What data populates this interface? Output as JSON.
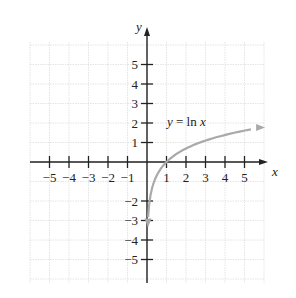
{
  "chart_data": {
    "type": "line",
    "title": "",
    "function_label": "y = ln x",
    "xlabel": "x",
    "ylabel": "y",
    "xlim": [
      -5,
      5
    ],
    "ylim": [
      -5,
      5
    ],
    "grid": true,
    "x_ticks": [
      "-5",
      "-4",
      "-3",
      "-2",
      "-1",
      "1",
      "2",
      "3",
      "4",
      "5"
    ],
    "y_ticks": [
      "5",
      "4",
      "3",
      "2",
      "1",
      "-2",
      "-3",
      "-4",
      "-5"
    ],
    "series": [
      {
        "name": "y = ln x",
        "x": [
          0.05,
          0.1,
          0.2,
          0.5,
          1,
          2,
          3,
          4,
          5,
          6
        ],
        "y": [
          -3.0,
          -2.3,
          -1.61,
          -0.69,
          0,
          0.69,
          1.1,
          1.39,
          1.61,
          1.79
        ]
      }
    ],
    "colors": {
      "curve": "#a9a9a9",
      "axes": "#222222",
      "grid": "#dddddd"
    }
  }
}
